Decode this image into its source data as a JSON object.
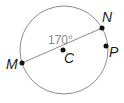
{
  "diagram": {
    "type": "circle-geometry",
    "circle": {
      "center": "C",
      "stroke": "#8c8c8c"
    },
    "points": [
      {
        "name": "M",
        "label": "M"
      },
      {
        "name": "C",
        "label": "C"
      },
      {
        "name": "N",
        "label": "N"
      },
      {
        "name": "P",
        "label": "P"
      }
    ],
    "segments": [
      {
        "from": "M",
        "to": "N",
        "through": "C",
        "kind": "diameter"
      }
    ],
    "angle_label": "170°",
    "colors": {
      "line": "#8c8c8c",
      "point": "#111111",
      "angle_text": "#8a8a8a",
      "label_text": "#1a1a1a"
    }
  }
}
